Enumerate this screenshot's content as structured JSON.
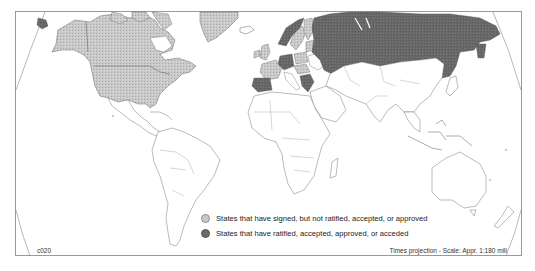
{
  "map": {
    "projection_note": "Times projection - Scale: Appr. 1:180 mill",
    "map_code": "c020",
    "colors": {
      "signed": "#c8c8c8",
      "ratified": "#6a6a6a",
      "none": "#ffffff",
      "border": "#7a7a7a",
      "frame": "#9a9a9a"
    },
    "regions": {
      "signed": [
        "North America (Canada, USA)",
        "Greenland",
        "Western Europe (UK, France, Sweden, Finland, Poland, others)"
      ],
      "ratified": [
        "Russia",
        "Spain",
        "Germany",
        "Norway",
        "Greece and Balkan states",
        "Kazakhstan (north)"
      ],
      "none": [
        "Latin America",
        "Africa",
        "Middle East",
        "South Asia",
        "East Asia",
        "Southeast Asia",
        "Australia",
        "New Zealand"
      ]
    }
  },
  "legend": {
    "items": [
      {
        "label": "States that have signed, but not ratified, accepted, or approved",
        "key": "signed"
      },
      {
        "label": "States that have ratified, accepted, approved, or acceded",
        "key": "ratified"
      }
    ]
  }
}
